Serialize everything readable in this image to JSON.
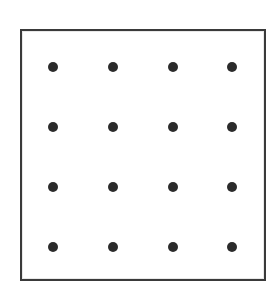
{
  "figure": {
    "name": "dot-grid",
    "background_color": "#ffffff"
  },
  "frame": {
    "name": "bounding-rectangle",
    "x": 20,
    "y": 29,
    "width": 246,
    "height": 252,
    "border_width": 2,
    "border_color": "#3a3a3a",
    "fill_color": "#ffffff"
  },
  "grid": {
    "rows": 4,
    "columns": 4,
    "dot_count": 16,
    "dot_diameter": 10,
    "dot_color": "#2b2b2b",
    "column_spacing": 60,
    "row_spacing": 60,
    "column_centers_x": [
      53,
      113,
      173,
      232
    ],
    "row_centers_y": [
      67,
      127,
      187,
      247
    ],
    "dots": [
      {
        "row": 1,
        "col": 1,
        "cx": 53,
        "cy": 67
      },
      {
        "row": 1,
        "col": 2,
        "cx": 113,
        "cy": 67
      },
      {
        "row": 1,
        "col": 3,
        "cx": 173,
        "cy": 67
      },
      {
        "row": 1,
        "col": 4,
        "cx": 232,
        "cy": 67
      },
      {
        "row": 2,
        "col": 1,
        "cx": 53,
        "cy": 127
      },
      {
        "row": 2,
        "col": 2,
        "cx": 113,
        "cy": 127
      },
      {
        "row": 2,
        "col": 3,
        "cx": 173,
        "cy": 127
      },
      {
        "row": 2,
        "col": 4,
        "cx": 232,
        "cy": 127
      },
      {
        "row": 3,
        "col": 1,
        "cx": 53,
        "cy": 187
      },
      {
        "row": 3,
        "col": 2,
        "cx": 113,
        "cy": 187
      },
      {
        "row": 3,
        "col": 3,
        "cx": 173,
        "cy": 187
      },
      {
        "row": 3,
        "col": 4,
        "cx": 232,
        "cy": 187
      },
      {
        "row": 4,
        "col": 1,
        "cx": 53,
        "cy": 247
      },
      {
        "row": 4,
        "col": 2,
        "cx": 113,
        "cy": 247
      },
      {
        "row": 4,
        "col": 3,
        "cx": 173,
        "cy": 247
      },
      {
        "row": 4,
        "col": 4,
        "cx": 232,
        "cy": 247
      }
    ]
  }
}
